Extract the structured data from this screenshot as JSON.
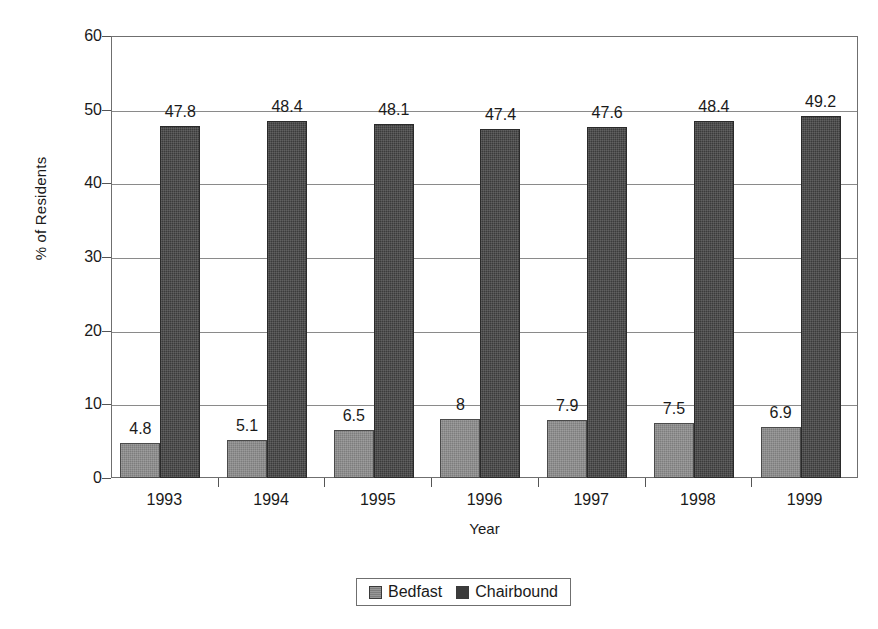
{
  "chart_data": {
    "type": "bar",
    "title": "",
    "xlabel": "Year",
    "ylabel": "% of Residents",
    "categories": [
      "1993",
      "1994",
      "1995",
      "1996",
      "1997",
      "1998",
      "1999"
    ],
    "series": [
      {
        "name": "Bedfast",
        "color": "#7d7d7d",
        "values": [
          4.8,
          5.1,
          6.5,
          8,
          7.9,
          7.5,
          6.9
        ],
        "labels": [
          "4.8",
          "5.1",
          "6.5",
          "8",
          "7.9",
          "7.5",
          "6.9"
        ]
      },
      {
        "name": "Chairbound",
        "color": "#3b3b3b",
        "values": [
          47.8,
          48.4,
          48.1,
          47.4,
          47.6,
          48.4,
          49.2
        ],
        "labels": [
          "47.8",
          "48.4",
          "48.1",
          "47.4",
          "47.6",
          "48.4",
          "49.2"
        ]
      }
    ],
    "ylim": [
      0,
      60
    ],
    "yticks": [
      0,
      10,
      20,
      30,
      40,
      50,
      60
    ],
    "ytick_labels": [
      "0",
      "10",
      "20",
      "30",
      "40",
      "50",
      "60"
    ],
    "grid": "horizontal",
    "legend_position": "bottom-center",
    "legend_entries": [
      "Bedfast",
      "Chairbound"
    ]
  }
}
